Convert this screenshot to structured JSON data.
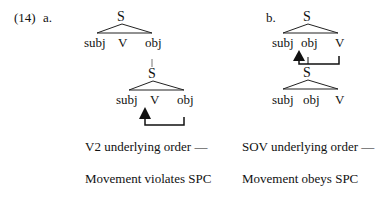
{
  "example": {
    "number": "(14)",
    "panel_a": {
      "label": "a.",
      "upper_tree": {
        "root": "S",
        "leaves": [
          "subj",
          "V",
          "obj"
        ]
      },
      "lower_tree": {
        "root": "S",
        "leaves": [
          "subj",
          "V",
          "obj"
        ]
      },
      "movement": "V moves leftward from final obj position to pre-V position (arrow from obj to between subj and V)",
      "caption_line1": "V2 underlying order —",
      "caption_line2": "Movement violates SPC"
    },
    "panel_b": {
      "label": "b.",
      "upper_tree": {
        "root": "S",
        "leaves": [
          "subj",
          "obj",
          "V"
        ]
      },
      "lower_tree": {
        "root": "S",
        "leaves": [
          "subj",
          "obj",
          "V"
        ]
      },
      "movement": "Arrow from obj and V lines to position between subj and obj",
      "caption_line1": "SOV underlying order —",
      "caption_line2": "Movement obeys SPC"
    }
  }
}
